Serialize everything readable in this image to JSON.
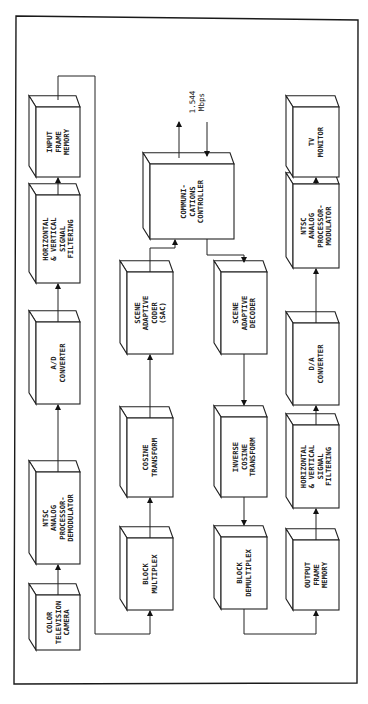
{
  "diagram": {
    "orientation": "rotated 90 degrees clockwise",
    "link_rate": {
      "line1": "1.544",
      "line2": "Mbps"
    },
    "encoder_chain": [
      {
        "id": "color-television-camera",
        "lines": [
          "COLOR",
          "TELEVISION",
          "CAMERA"
        ]
      },
      {
        "id": "ntsc-analog-processor-demodulator",
        "lines": [
          "NTSC",
          "ANALOG",
          "PROCESSOR-",
          "DEMODULATOR"
        ]
      },
      {
        "id": "a-d-converter",
        "lines": [
          "A/D",
          "CONVERTER"
        ]
      },
      {
        "id": "horizontal-vertical-signal-filtering-in",
        "lines": [
          "HORIZONTAL",
          "& VERTICAL",
          "SIGNAL",
          "FILTERING"
        ]
      },
      {
        "id": "input-frame-memory",
        "lines": [
          "INPUT",
          "FRAME",
          "MEMORY"
        ]
      }
    ],
    "coder_chain": [
      {
        "id": "block-multiplex",
        "lines": [
          "BLOCK",
          "MULTIPLEX"
        ]
      },
      {
        "id": "cosine-transform",
        "lines": [
          "COSINE",
          "TRANSFORM"
        ]
      },
      {
        "id": "scene-adaptive-coder",
        "lines": [
          "SCENE",
          "ADAPTIVE",
          "CODER",
          "(SAC)"
        ]
      }
    ],
    "controller": {
      "id": "communications-controller",
      "lines": [
        "COMMUNI-",
        "CATIONS",
        "CONTROLLER"
      ]
    },
    "decoder_chain": [
      {
        "id": "scene-adaptive-decoder",
        "lines": [
          "SCENE",
          "ADAPTIVE",
          "DECODER"
        ]
      },
      {
        "id": "inverse-cosine-transform",
        "lines": [
          "INVERSE",
          "COSINE",
          "TRANSFORM"
        ]
      },
      {
        "id": "block-demultiplex",
        "lines": [
          "BLOCK",
          "DEMULTIPLEX"
        ]
      }
    ],
    "output_chain": [
      {
        "id": "output-frame-memory",
        "lines": [
          "OUTPUT",
          "FRAME",
          "MEMORY"
        ]
      },
      {
        "id": "horizontal-vertical-signal-filtering-out",
        "lines": [
          "HORIZONTAL",
          "& VERTICAL",
          "SIGNAL",
          "FILTERING"
        ]
      },
      {
        "id": "d-a-converter",
        "lines": [
          "D/A",
          "CONVERTER"
        ]
      },
      {
        "id": "ntsc-analog-processor-modulator",
        "lines": [
          "NTSC",
          "ANALOG",
          "PROCESSOR-",
          "MODULATOR"
        ]
      },
      {
        "id": "tv-monitor",
        "lines": [
          "TV",
          "MONITOR"
        ]
      }
    ]
  }
}
